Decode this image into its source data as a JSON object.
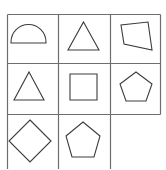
{
  "figure": {
    "kind": "geometric-shape-grid-puzzle",
    "rows": 3,
    "columns": 3,
    "background_color": "#ffffff",
    "grid_line_color": "#6e6e6e",
    "shape_line_color": "#3c3c3c",
    "shape_fill": "none",
    "grid": {
      "left": 7.5,
      "top": 14.5,
      "cell_width": 51,
      "cell_height": 50,
      "line_width": 1.2
    },
    "missing_cell": {
      "row": 3,
      "column": 3,
      "label": "empty"
    },
    "cells": [
      {
        "index": 1,
        "row": 1,
        "column": 1,
        "shape": "semicircle",
        "label": "Semicircle",
        "empty": false,
        "points": "",
        "path": "M 11 42 A 17.5 17.5 0 0 1 46 42 L 46 43 L 11 43 Z"
      },
      {
        "index": 2,
        "row": 1,
        "column": 2,
        "shape": "triangle",
        "label": "Triangle",
        "empty": false,
        "points": "83.5,22 99,50 68,50",
        "path": ""
      },
      {
        "index": 3,
        "row": 1,
        "column": 3,
        "shape": "rhombus",
        "label": "Rhombus",
        "empty": false,
        "points": "148,22 152,50 124,44 121,25",
        "path": ""
      },
      {
        "index": 4,
        "row": 2,
        "column": 1,
        "shape": "triangle",
        "label": "Triangle",
        "empty": false,
        "points": "29,72 44,100 14,100",
        "path": ""
      },
      {
        "index": 5,
        "row": 2,
        "column": 2,
        "shape": "square",
        "label": "Square",
        "empty": false,
        "points": "70,74 97,74 97,100 70,100",
        "path": ""
      },
      {
        "index": 6,
        "row": 2,
        "column": 3,
        "shape": "pentagon",
        "label": "Pentagon",
        "empty": false,
        "points": "136,72 152,84 146,101 126,101 120,84",
        "path": ""
      },
      {
        "index": 7,
        "row": 3,
        "column": 1,
        "shape": "diamond",
        "label": "Diamond",
        "empty": false,
        "points": "30,120 51,141 30,162 9,141",
        "path": ""
      },
      {
        "index": 8,
        "row": 3,
        "column": 2,
        "shape": "pentagon",
        "label": "Pentagon",
        "empty": false,
        "points": "83,122 100,136 94,157 72,157 66,136",
        "path": ""
      },
      {
        "index": 9,
        "row": 3,
        "column": 3,
        "shape": "none",
        "label": "",
        "empty": true,
        "points": "",
        "path": ""
      }
    ],
    "grid_lines": [
      {
        "name": "outer-top",
        "x1": 7.5,
        "y1": 14.5,
        "x2": 160.5,
        "y2": 14.5
      },
      {
        "name": "divider-row-1",
        "x1": 7.5,
        "y1": 63.5,
        "x2": 160.5,
        "y2": 63.5
      },
      {
        "name": "divider-row-2",
        "x1": 7.5,
        "y1": 114.5,
        "x2": 160.5,
        "y2": 114.5
      },
      {
        "name": "outer-left",
        "x1": 7.5,
        "y1": 14.5,
        "x2": 7.5,
        "y2": 169
      },
      {
        "name": "divider-col-1",
        "x1": 58.5,
        "y1": 14.5,
        "x2": 58.5,
        "y2": 169
      },
      {
        "name": "divider-col-2",
        "x1": 110.5,
        "y1": 14.5,
        "x2": 110.5,
        "y2": 169
      },
      {
        "name": "outer-right",
        "x1": 160.5,
        "y1": 14.5,
        "x2": 160.5,
        "y2": 114.5
      }
    ]
  }
}
